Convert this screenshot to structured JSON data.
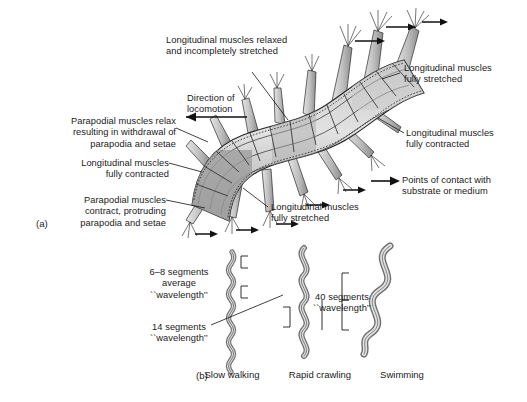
{
  "figure": {
    "panels": [
      {
        "tag": "(a)",
        "description": "dorsal view of crawling polychaete with parapodia"
      },
      {
        "tag": "(b)",
        "description": "three body wave forms at increasing speed"
      }
    ]
  },
  "panel_a": {
    "tag": "(a)",
    "labels": {
      "relaxed": "Longitudinal muscles relaxed\nand incompletely stretched",
      "direction": "Direction of\nlocomotion",
      "parapodia_relax": "Parapodial muscles relax\nresulting in withdrawal of\nparapodia and setae",
      "contracted_left": "Longitudinal muscles\nfully contracted",
      "parapodia_contract": "Parapodial muscles\ncontract, protruding\nparapodia and setae",
      "stretched_right": "Longitudinal muscles\nfully stretched",
      "contracted_right": "Longitudinal muscles\nfully contracted",
      "stretched_bottom": "Longitudinal muscles\nfully stretched",
      "legend_contact": "Points of contact with\nsubstrate or medium"
    }
  },
  "panel_b": {
    "tag": "(b)",
    "labels": {
      "wavelength_6_8": "6–8 segments\naverage\n``wavelength’’",
      "wavelength_14": "14 segments\n``wavelength’’",
      "wavelength_40": "40 segments\n``wavelength’’"
    },
    "captions": [
      {
        "name": "slow-walking",
        "text": "Slow walking"
      },
      {
        "name": "rapid-crawling",
        "text": "Rapid crawling"
      },
      {
        "name": "swimming",
        "text": "Swimming"
      }
    ]
  },
  "colors": {
    "ink": "#1a1a1a",
    "body_light": "#d8d8d8",
    "body_mid": "#b9b9b9",
    "body_dark": "#9a9a9a",
    "body_darker": "#7e7e7e",
    "parapodia": "#c2c2c2",
    "background": "#ffffff"
  }
}
